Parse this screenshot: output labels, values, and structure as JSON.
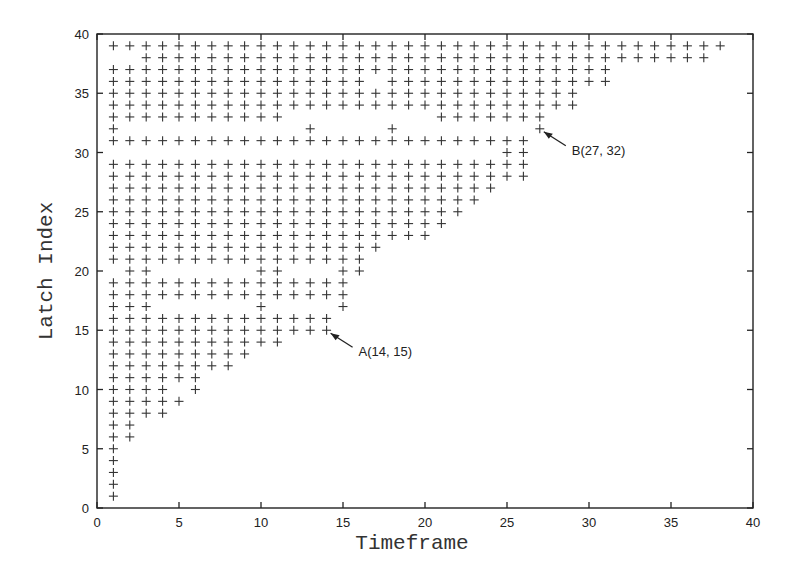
{
  "chart_data": {
    "type": "scatter",
    "title": "",
    "xlabel": "Timeframe",
    "ylabel": "Latch Index",
    "xlim": [
      0,
      40
    ],
    "ylim": [
      0,
      40
    ],
    "xticks": [
      0,
      5,
      10,
      15,
      20,
      25,
      30,
      35,
      40
    ],
    "yticks": [
      0,
      5,
      10,
      15,
      20,
      25,
      30,
      35,
      40
    ],
    "grid": false,
    "legend": null,
    "marker": "+",
    "rows": [
      {
        "y": 39,
        "x_ranges": [
          [
            1,
            38
          ]
        ]
      },
      {
        "y": 38,
        "x_ranges": [
          [
            3,
            37
          ]
        ]
      },
      {
        "y": 37,
        "x_ranges": [
          [
            1,
            31
          ]
        ]
      },
      {
        "y": 36,
        "x_ranges": [
          [
            1,
            16
          ],
          [
            18,
            31
          ]
        ]
      },
      {
        "y": 35,
        "x_ranges": [
          [
            1,
            29
          ]
        ]
      },
      {
        "y": 34,
        "x_ranges": [
          [
            1,
            29
          ]
        ]
      },
      {
        "y": 33,
        "x_ranges": [
          [
            1,
            11
          ],
          [
            21,
            27
          ]
        ]
      },
      {
        "y": 32,
        "x_ranges": [
          [
            1,
            1
          ],
          [
            13,
            13
          ],
          [
            18,
            18
          ],
          [
            27,
            27
          ]
        ]
      },
      {
        "y": 31,
        "x_ranges": [
          [
            1,
            26
          ]
        ]
      },
      {
        "y": 30,
        "x_ranges": [
          [
            25,
            26
          ]
        ]
      },
      {
        "y": 29,
        "x_ranges": [
          [
            1,
            26
          ]
        ]
      },
      {
        "y": 28,
        "x_ranges": [
          [
            1,
            26
          ]
        ]
      },
      {
        "y": 27,
        "x_ranges": [
          [
            1,
            24
          ]
        ]
      },
      {
        "y": 26,
        "x_ranges": [
          [
            1,
            23
          ]
        ]
      },
      {
        "y": 25,
        "x_ranges": [
          [
            1,
            22
          ]
        ]
      },
      {
        "y": 24,
        "x_ranges": [
          [
            1,
            21
          ]
        ]
      },
      {
        "y": 23,
        "x_ranges": [
          [
            1,
            20
          ]
        ]
      },
      {
        "y": 22,
        "x_ranges": [
          [
            1,
            17
          ]
        ]
      },
      {
        "y": 21,
        "x_ranges": [
          [
            1,
            16
          ]
        ]
      },
      {
        "y": 20,
        "x_ranges": [
          [
            2,
            3
          ],
          [
            10,
            11
          ],
          [
            15,
            16
          ]
        ]
      },
      {
        "y": 19,
        "x_ranges": [
          [
            1,
            15
          ]
        ]
      },
      {
        "y": 18,
        "x_ranges": [
          [
            1,
            15
          ]
        ]
      },
      {
        "y": 17,
        "x_ranges": [
          [
            1,
            3
          ],
          [
            10,
            10
          ],
          [
            15,
            15
          ]
        ]
      },
      {
        "y": 16,
        "x_ranges": [
          [
            1,
            14
          ]
        ]
      },
      {
        "y": 15,
        "x_ranges": [
          [
            1,
            14
          ]
        ]
      },
      {
        "y": 14,
        "x_ranges": [
          [
            1,
            11
          ]
        ]
      },
      {
        "y": 13,
        "x_ranges": [
          [
            1,
            9
          ]
        ]
      },
      {
        "y": 12,
        "x_ranges": [
          [
            1,
            8
          ]
        ]
      },
      {
        "y": 11,
        "x_ranges": [
          [
            1,
            6
          ]
        ]
      },
      {
        "y": 10,
        "x_ranges": [
          [
            1,
            4
          ],
          [
            6,
            6
          ]
        ]
      },
      {
        "y": 9,
        "x_ranges": [
          [
            1,
            5
          ]
        ]
      },
      {
        "y": 8,
        "x_ranges": [
          [
            1,
            4
          ]
        ]
      },
      {
        "y": 7,
        "x_ranges": [
          [
            1,
            2
          ]
        ]
      },
      {
        "y": 6,
        "x_ranges": [
          [
            1,
            2
          ]
        ]
      },
      {
        "y": 5,
        "x_ranges": [
          [
            1,
            1
          ]
        ]
      },
      {
        "y": 4,
        "x_ranges": [
          [
            1,
            1
          ]
        ]
      },
      {
        "y": 3,
        "x_ranges": [
          [
            1,
            1
          ]
        ]
      },
      {
        "y": 2,
        "x_ranges": [
          [
            1,
            1
          ]
        ]
      },
      {
        "y": 1,
        "x_ranges": [
          [
            1,
            1
          ]
        ]
      }
    ],
    "annotations": [
      {
        "label": "A(14, 15)",
        "x": 14,
        "y": 15
      },
      {
        "label": "B(27, 32)",
        "x": 27,
        "y": 32
      }
    ]
  }
}
